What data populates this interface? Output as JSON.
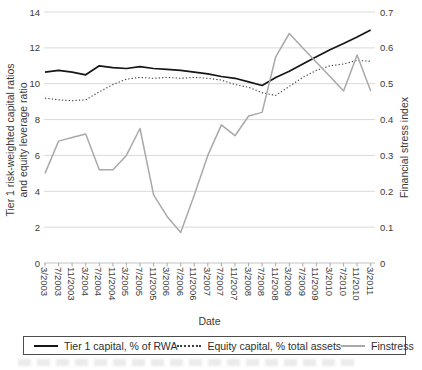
{
  "chart_data": {
    "type": "line",
    "title": "",
    "grid": "horizontal",
    "legend_position": "bottom",
    "x_axis": {
      "label": "Date",
      "categories": [
        "3/2003",
        "7/2003",
        "11/2003",
        "3/2004",
        "7/2004",
        "11/2004",
        "3/2005",
        "7/2005",
        "11/2005",
        "3/2006",
        "7/2006",
        "11/2006",
        "3/2007",
        "7/2007",
        "11/2007",
        "3/2008",
        "7/2008",
        "11/2008",
        "3/2009",
        "7/2009",
        "11/2009",
        "3/2010",
        "7/2010",
        "11/2010",
        "3/2011"
      ]
    },
    "y_axis_left": {
      "label_line1": "Tier 1 risk-weighted capital ratios",
      "label_line2": "and equity leverage ratio",
      "min": 0,
      "max": 14,
      "ticks": [
        "0",
        "2",
        "4",
        "6",
        "8",
        "10",
        "12",
        "14"
      ]
    },
    "y_axis_right": {
      "label": "Financial stress index",
      "min": 0,
      "max": 0.7,
      "ticks": [
        "0",
        "0.1",
        "0.2",
        "0.3",
        "0.4",
        "0.5",
        "0.6",
        "0.7"
      ]
    },
    "series": [
      {
        "name": "Tier 1 capital, % of RWA",
        "axis": "left",
        "line_style": "solid",
        "color": "#161616",
        "stroke_width": 1.7,
        "values": [
          10.65,
          10.75,
          10.65,
          10.5,
          11.0,
          10.9,
          10.85,
          10.95,
          10.85,
          10.8,
          10.75,
          10.65,
          10.55,
          10.4,
          10.3,
          10.1,
          9.9,
          10.35,
          10.7,
          11.1,
          11.5,
          11.9,
          12.25,
          12.6,
          13.0
        ]
      },
      {
        "name": "Equity capital, % total assets",
        "axis": "left",
        "line_style": "dotted",
        "color": "#3d3d3d",
        "stroke_width": 1.1,
        "values": [
          9.2,
          9.1,
          9.05,
          9.1,
          9.55,
          9.95,
          10.25,
          10.35,
          10.3,
          10.35,
          10.3,
          10.35,
          10.3,
          10.2,
          9.95,
          9.8,
          9.5,
          9.35,
          9.85,
          10.35,
          10.75,
          11.0,
          11.1,
          11.3,
          11.25
        ]
      },
      {
        "name": "Finstress",
        "axis": "right",
        "line_style": "solid",
        "color": "#a9a9a9",
        "stroke_width": 1.5,
        "values": [
          0.25,
          0.34,
          0.35,
          0.36,
          0.26,
          0.26,
          0.3,
          0.375,
          0.19,
          0.13,
          0.085,
          0.19,
          0.3,
          0.385,
          0.355,
          0.41,
          0.42,
          0.575,
          0.64,
          0.6,
          0.56,
          0.52,
          0.48,
          0.58,
          0.48
        ]
      }
    ]
  },
  "colors": {
    "background": "#ffffff",
    "gridline": "#d9d9d9",
    "axis_line": "#c3c3c3",
    "tick_mark": "#9e9e9e",
    "text": "#3a3a3a",
    "legend_border": "#4d4d4d"
  }
}
